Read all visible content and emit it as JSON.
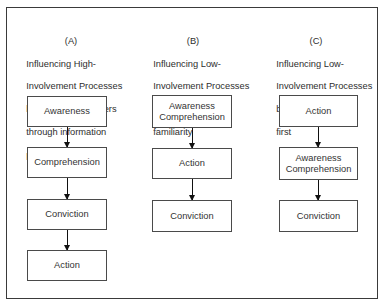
{
  "columns": [
    {
      "letter": "(A)",
      "lines": [
        "Influencing High-",
        "Involvement Processes",
        "by leading consumers",
        "through information",
        "process activities"
      ],
      "steps": [
        "Awareness",
        "Comprehension",
        "Conviction",
        "Action"
      ]
    },
    {
      "letter": "(B)",
      "lines": [
        "Influencing Low-",
        "Involvement Processes",
        "by building brand",
        "familiarity"
      ],
      "steps": [
        "Awareness\nComprehension",
        "Action",
        "Conviction"
      ]
    },
    {
      "letter": "(C)",
      "lines": [
        "Influencing Low-",
        "Involvement Processes",
        "by getting action",
        "first"
      ],
      "steps": [
        "Action",
        "Awareness\nComprehension",
        "Conviction"
      ]
    }
  ]
}
